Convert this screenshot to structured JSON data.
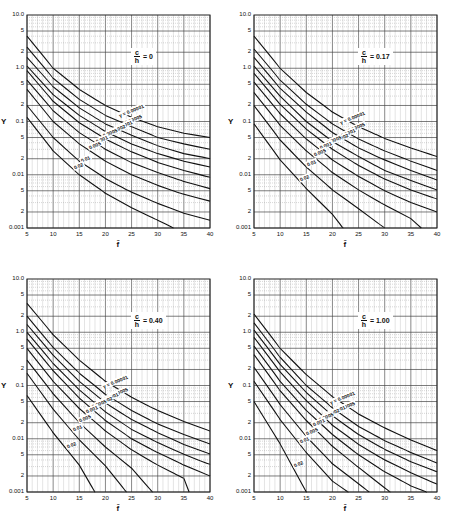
{
  "chart_data": [
    {
      "type": "line",
      "title": "c/h = 0",
      "panel_label": "0",
      "xlabel": "f̄",
      "ylabel": "Y",
      "xlim": [
        5,
        40
      ],
      "ylim": [
        0.001,
        10.0
      ],
      "yscale": "log",
      "x_ticks": [
        "5",
        "10",
        "15",
        "20",
        "25",
        "30",
        "35",
        "40"
      ],
      "y_ticks": [
        "10.0",
        "5",
        "2",
        "1.0",
        "5",
        "2",
        "0.1",
        "5",
        "2",
        "0.01",
        "5",
        "2",
        "0.001"
      ],
      "grid": true,
      "legend_title": "γ =",
      "series": [
        {
          "name": "0.00001",
          "x": [
            5,
            10,
            15,
            20,
            25,
            30,
            35,
            40
          ],
          "values": [
            4.0,
            1.0,
            0.4,
            0.2,
            0.12,
            0.08,
            0.06,
            0.05
          ]
        },
        {
          "name": "0.00005",
          "x": [
            5,
            10,
            15,
            20,
            25,
            30,
            35,
            40
          ],
          "values": [
            2.5,
            0.65,
            0.26,
            0.13,
            0.08,
            0.05,
            0.038,
            0.03
          ]
        },
        {
          "name": "0.0001",
          "x": [
            5,
            10,
            15,
            20,
            25,
            30,
            35,
            40
          ],
          "values": [
            1.6,
            0.45,
            0.18,
            0.09,
            0.055,
            0.035,
            0.025,
            0.02
          ]
        },
        {
          "name": "0.0002",
          "x": [
            5,
            10,
            15,
            20,
            25,
            30,
            35,
            40
          ],
          "values": [
            1.1,
            0.32,
            0.13,
            0.065,
            0.038,
            0.025,
            0.018,
            0.014
          ]
        },
        {
          "name": "0.0005",
          "x": [
            5,
            10,
            15,
            20,
            25,
            30,
            35,
            40
          ],
          "values": [
            0.9,
            0.24,
            0.095,
            0.047,
            0.027,
            0.017,
            0.012,
            0.009
          ]
        },
        {
          "name": "0.001",
          "x": [
            5,
            10,
            15,
            20,
            25,
            30,
            35,
            40
          ],
          "values": [
            0.6,
            0.16,
            0.062,
            0.03,
            0.017,
            0.011,
            0.0075,
            0.0055
          ]
        },
        {
          "name": "0.005",
          "x": [
            5,
            10,
            15,
            20,
            25,
            30,
            35,
            40
          ],
          "values": [
            0.4,
            0.1,
            0.038,
            0.018,
            0.01,
            0.0063,
            0.0043,
            0.0032
          ]
        },
        {
          "name": "0.01",
          "x": [
            5,
            10,
            15,
            20,
            25,
            30,
            35,
            40
          ],
          "values": [
            0.2,
            0.05,
            0.018,
            0.0085,
            0.0047,
            0.0029,
            0.0019,
            0.0014
          ]
        },
        {
          "name": "0.02",
          "x": [
            5,
            10,
            15,
            20,
            25,
            30,
            33
          ],
          "values": [
            0.12,
            0.028,
            0.01,
            0.0045,
            0.0024,
            0.0014,
            0.001
          ]
        }
      ]
    },
    {
      "type": "line",
      "title": "c/h = 0.17",
      "panel_label": "0.17",
      "xlabel": "f̄",
      "ylabel": "Y",
      "xlim": [
        5,
        40
      ],
      "ylim": [
        0.001,
        10.0
      ],
      "yscale": "log",
      "x_ticks": [
        "5",
        "10",
        "15",
        "20",
        "25",
        "30",
        "35",
        "40"
      ],
      "y_ticks": [
        "10.0",
        "5",
        "2",
        "1.0",
        "5",
        "2",
        "0.1",
        "5",
        "2",
        "0.01",
        "5",
        "2",
        "0.001"
      ],
      "grid": true,
      "legend_title": "γ =",
      "series": [
        {
          "name": "0.00001",
          "x": [
            5,
            10,
            15,
            20,
            25,
            30,
            35,
            40
          ],
          "values": [
            4.0,
            1.0,
            0.35,
            0.15,
            0.08,
            0.048,
            0.032,
            0.022
          ]
        },
        {
          "name": "0.00005",
          "x": [
            5,
            10,
            15,
            20,
            25,
            30,
            35,
            40
          ],
          "values": [
            2.3,
            0.6,
            0.21,
            0.09,
            0.047,
            0.028,
            0.018,
            0.012
          ]
        },
        {
          "name": "0.0001",
          "x": [
            5,
            10,
            15,
            20,
            25,
            30,
            35,
            40
          ],
          "values": [
            1.6,
            0.42,
            0.15,
            0.062,
            0.032,
            0.019,
            0.012,
            0.008
          ]
        },
        {
          "name": "0.0002",
          "x": [
            5,
            10,
            15,
            20,
            25,
            30,
            35,
            40
          ],
          "values": [
            1.1,
            0.3,
            0.1,
            0.042,
            0.022,
            0.012,
            0.0078,
            0.0052
          ]
        },
        {
          "name": "0.0005",
          "x": [
            5,
            10,
            15,
            20,
            25,
            30,
            35,
            40
          ],
          "values": [
            0.8,
            0.21,
            0.072,
            0.03,
            0.015,
            0.0083,
            0.0052,
            0.0035
          ]
        },
        {
          "name": "0.001",
          "x": [
            5,
            10,
            15,
            20,
            25,
            30,
            35,
            40
          ],
          "values": [
            0.55,
            0.14,
            0.047,
            0.019,
            0.0093,
            0.005,
            0.003,
            0.002
          ]
        },
        {
          "name": "0.005",
          "x": [
            5,
            10,
            15,
            20,
            25,
            30,
            35,
            37
          ],
          "values": [
            0.35,
            0.085,
            0.028,
            0.011,
            0.0052,
            0.0027,
            0.0015,
            0.001
          ]
        },
        {
          "name": "0.01",
          "x": [
            5,
            10,
            15,
            20,
            25,
            30
          ],
          "values": [
            0.2,
            0.045,
            0.014,
            0.0052,
            0.0023,
            0.001
          ]
        },
        {
          "name": "0.02",
          "x": [
            5,
            10,
            15,
            20,
            22
          ],
          "values": [
            0.09,
            0.019,
            0.0055,
            0.0018,
            0.001
          ]
        }
      ]
    },
    {
      "type": "line",
      "title": "c/h = 0.40",
      "panel_label": "0.40",
      "xlabel": "f̄",
      "ylabel": "Y",
      "xlim": [
        5,
        40
      ],
      "ylim": [
        0.001,
        10.0
      ],
      "yscale": "log",
      "x_ticks": [
        "5",
        "10",
        "15",
        "20",
        "25",
        "30",
        "35",
        "40"
      ],
      "y_ticks": [
        "10.0",
        "5",
        "2",
        "1.0",
        "5",
        "2",
        "0.1",
        "5",
        "2",
        "0.01",
        "5",
        "2",
        "0.001"
      ],
      "grid": true,
      "legend_title": "γ =",
      "series": [
        {
          "name": "0.00001",
          "x": [
            5,
            10,
            15,
            20,
            25,
            30,
            35,
            40
          ],
          "values": [
            3.5,
            0.9,
            0.3,
            0.12,
            0.06,
            0.034,
            0.021,
            0.014
          ]
        },
        {
          "name": "0.00005",
          "x": [
            5,
            10,
            15,
            20,
            25,
            30,
            35,
            40
          ],
          "values": [
            2.0,
            0.52,
            0.17,
            0.068,
            0.034,
            0.019,
            0.012,
            0.008
          ]
        },
        {
          "name": "0.0001",
          "x": [
            5,
            10,
            15,
            20,
            25,
            30,
            35,
            40
          ],
          "values": [
            1.4,
            0.37,
            0.12,
            0.047,
            0.023,
            0.013,
            0.0078,
            0.0052
          ]
        },
        {
          "name": "0.0002",
          "x": [
            5,
            10,
            15,
            20,
            25,
            30,
            35,
            40
          ],
          "values": [
            1.0,
            0.26,
            0.083,
            0.032,
            0.015,
            0.0085,
            0.0051,
            0.0033
          ]
        },
        {
          "name": "0.0005",
          "x": [
            5,
            10,
            15,
            20,
            25,
            30,
            35,
            40
          ],
          "values": [
            0.75,
            0.19,
            0.058,
            0.022,
            0.01,
            0.0055,
            0.0032,
            0.002
          ]
        },
        {
          "name": "0.001",
          "x": [
            5,
            10,
            15,
            20,
            25,
            30,
            35,
            36
          ],
          "values": [
            0.5,
            0.12,
            0.037,
            0.014,
            0.0062,
            0.0032,
            0.0018,
            0.001
          ]
        },
        {
          "name": "0.005",
          "x": [
            5,
            10,
            15,
            20,
            25,
            29
          ],
          "values": [
            0.3,
            0.07,
            0.02,
            0.007,
            0.0028,
            0.001
          ]
        },
        {
          "name": "0.01",
          "x": [
            5,
            10,
            15,
            20,
            24
          ],
          "values": [
            0.17,
            0.036,
            0.0095,
            0.0031,
            0.001
          ]
        },
        {
          "name": "0.02",
          "x": [
            5,
            10,
            15,
            18
          ],
          "values": [
            0.065,
            0.013,
            0.0032,
            0.001
          ]
        }
      ]
    },
    {
      "type": "line",
      "title": "c/h = 1.00",
      "panel_label": "1.00",
      "xlabel": "f̄",
      "ylabel": "Y",
      "xlim": [
        5,
        40
      ],
      "ylim": [
        0.001,
        10.0
      ],
      "yscale": "log",
      "x_ticks": [
        "5",
        "10",
        "15",
        "20",
        "25",
        "30",
        "35",
        "40"
      ],
      "y_ticks": [
        "10.0",
        "5",
        "2",
        "1.0",
        "5",
        "2",
        "0.1",
        "5",
        "2",
        "0.01",
        "5",
        "2",
        "0.001"
      ],
      "grid": true,
      "legend_title": "γ =",
      "series": [
        {
          "name": "0.00001",
          "x": [
            5,
            10,
            15,
            20,
            25,
            30,
            35,
            40
          ],
          "values": [
            2.2,
            0.5,
            0.16,
            0.062,
            0.029,
            0.016,
            0.0095,
            0.006
          ]
        },
        {
          "name": "0.00005",
          "x": [
            5,
            10,
            15,
            20,
            25,
            30,
            35,
            40
          ],
          "values": [
            1.5,
            0.34,
            0.1,
            0.038,
            0.017,
            0.0092,
            0.0055,
            0.0035
          ]
        },
        {
          "name": "0.0001",
          "x": [
            5,
            10,
            15,
            20,
            25,
            30,
            35,
            40
          ],
          "values": [
            1.1,
            0.25,
            0.074,
            0.027,
            0.012,
            0.0063,
            0.0037,
            0.0024
          ]
        },
        {
          "name": "0.0002",
          "x": [
            5,
            10,
            15,
            20,
            25,
            30,
            35,
            40
          ],
          "values": [
            0.8,
            0.18,
            0.052,
            0.018,
            0.0078,
            0.004,
            0.0023,
            0.0014
          ]
        },
        {
          "name": "0.0005",
          "x": [
            5,
            10,
            15,
            20,
            25,
            30,
            35,
            38
          ],
          "values": [
            0.55,
            0.12,
            0.034,
            0.012,
            0.005,
            0.0024,
            0.0013,
            0.001
          ]
        },
        {
          "name": "0.001",
          "x": [
            5,
            10,
            15,
            20,
            25,
            31
          ],
          "values": [
            0.38,
            0.08,
            0.022,
            0.0072,
            0.0029,
            0.001
          ]
        },
        {
          "name": "0.005",
          "x": [
            5,
            10,
            15,
            20,
            27
          ],
          "values": [
            0.22,
            0.044,
            0.011,
            0.0034,
            0.001
          ]
        },
        {
          "name": "0.01",
          "x": [
            5,
            10,
            15,
            20,
            23
          ],
          "values": [
            0.12,
            0.023,
            0.0055,
            0.0016,
            0.001
          ]
        },
        {
          "name": "0.02",
          "x": [
            5,
            10,
            15
          ],
          "values": [
            0.05,
            0.008,
            0.001
          ]
        }
      ]
    }
  ],
  "axes": {
    "y_title": "Y",
    "x_title": "f̄",
    "ratio_numerator": "c",
    "ratio_denominator": "h",
    "equals": "="
  }
}
